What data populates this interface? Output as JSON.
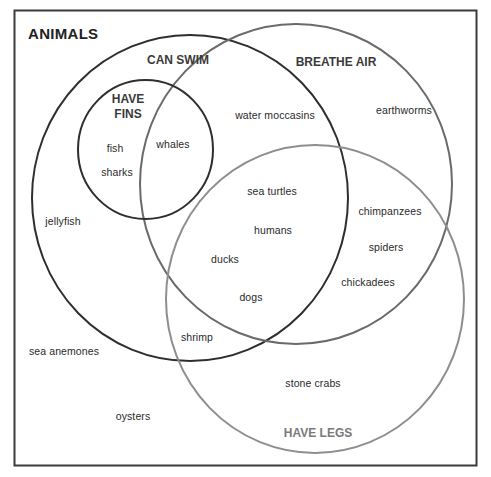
{
  "title": "ANIMALS",
  "sets": {
    "can_swim": {
      "label": "CAN SWIM",
      "stroke": "#2e2e2e"
    },
    "breathe_air": {
      "label": "BREATHE AIR",
      "stroke": "#6a6a6a"
    },
    "have_legs": {
      "label": "HAVE LEGS",
      "stroke": "#8e8e8e",
      "label_color": "#7a7a7a"
    },
    "have_fins_line1": "HAVE",
    "have_fins_line2": "FINS",
    "have_fins": {
      "stroke": "#2e2e2e"
    }
  },
  "animals": {
    "fish": "fish",
    "sharks": "sharks",
    "whales": "whales",
    "water_moccasins": "water moccasins",
    "earthworms": "earthworms",
    "sea_turtles": "sea turtles",
    "humans": "humans",
    "ducks": "ducks",
    "dogs": "dogs",
    "chimpanzees": "chimpanzees",
    "spiders": "spiders",
    "chickadees": "chickadees",
    "jellyfish": "jellyfish",
    "shrimp": "shrimp",
    "sea_anemones": "sea anemones",
    "stone_crabs": "stone crabs",
    "oysters": "oysters"
  },
  "regions": {
    "can_swim_only": [
      "jellyfish"
    ],
    "have_fins_can_swim_only": [
      "fish",
      "sharks"
    ],
    "have_fins_can_swim_breathe_air": [
      "whales"
    ],
    "can_swim_breathe_air": [
      "water moccasins"
    ],
    "breathe_air_only": [
      "earthworms"
    ],
    "can_swim_breathe_air_have_legs": [
      "sea turtles",
      "humans",
      "ducks",
      "dogs"
    ],
    "breathe_air_have_legs": [
      "chimpanzees",
      "spiders",
      "chickadees"
    ],
    "can_swim_have_legs": [
      "shrimp"
    ],
    "have_legs_only": [
      "stone crabs"
    ],
    "none": [
      "sea anemones",
      "oysters"
    ]
  }
}
